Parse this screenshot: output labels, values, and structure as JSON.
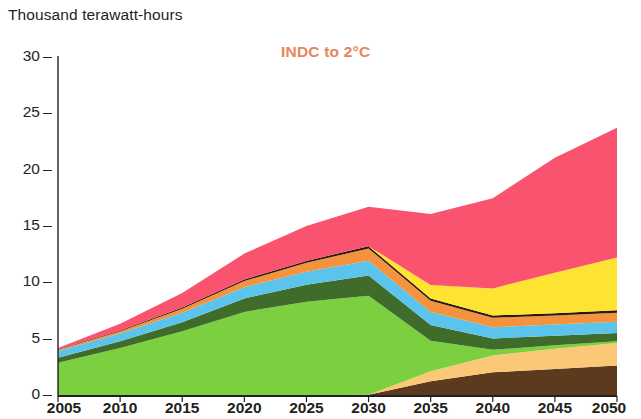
{
  "chart_data": {
    "type": "area",
    "title": "INDC to 2°C",
    "title_color": "#e8865a",
    "ylabel": "Thousand terawatt-hours",
    "xlabel": "",
    "stacked": true,
    "grid": false,
    "legend_position": "none",
    "xlim": [
      2005,
      2050
    ],
    "ylim": [
      0,
      30
    ],
    "ytick_labels": [
      "0",
      "5",
      "10",
      "15",
      "20",
      "25",
      "30"
    ],
    "ytick_values": [
      0,
      5,
      10,
      15,
      20,
      25,
      30
    ],
    "xtick_labels": [
      "2005",
      "2010",
      "2015",
      "2020",
      "2025",
      "2030",
      "2035",
      "2040",
      "2045",
      "2050"
    ],
    "x": [
      2005,
      2010,
      2015,
      2020,
      2025,
      2030,
      2035,
      2040,
      2045,
      2050
    ],
    "series": [
      {
        "name": "coal",
        "color": "#5c3a1d",
        "values": [
          0.05,
          0.05,
          0.05,
          0.06,
          0.07,
          0.1,
          1.3,
          2.1,
          2.4,
          2.7
        ]
      },
      {
        "name": "natural-gas",
        "color": "#fac877",
        "values": [
          0.0,
          0.0,
          0.0,
          0.0,
          0.0,
          0.0,
          0.9,
          1.5,
          1.8,
          2.0
        ]
      },
      {
        "name": "fossil-mix",
        "color": "#7ccf3f",
        "values": [
          2.9,
          4.2,
          5.7,
          7.4,
          8.3,
          8.8,
          2.7,
          0.5,
          0.3,
          0.15
        ]
      },
      {
        "name": "nuclear",
        "color": "#3f6b2b",
        "values": [
          0.45,
          0.6,
          0.8,
          1.2,
          1.5,
          1.8,
          1.4,
          1.0,
          0.85,
          0.75
        ]
      },
      {
        "name": "hydro",
        "color": "#5bc4ec",
        "values": [
          0.6,
          0.7,
          0.85,
          1.0,
          1.15,
          1.3,
          1.15,
          1.0,
          1.0,
          1.0
        ]
      },
      {
        "name": "bioenergy",
        "color": "#f5923e",
        "values": [
          0.1,
          0.2,
          0.35,
          0.55,
          0.8,
          1.1,
          1.0,
          0.85,
          0.8,
          0.8
        ]
      },
      {
        "name": "geothermal",
        "color": "#2b1a0c",
        "values": [
          0.05,
          0.07,
          0.1,
          0.13,
          0.17,
          0.2,
          0.2,
          0.2,
          0.2,
          0.2
        ]
      },
      {
        "name": "wind",
        "color": "#ffe332",
        "values": [
          0.0,
          0.0,
          0.0,
          0.0,
          0.0,
          0.0,
          1.2,
          2.4,
          3.6,
          4.7
        ]
      },
      {
        "name": "solar",
        "color": "#f9536f",
        "values": [
          0.1,
          0.6,
          1.3,
          2.3,
          3.1,
          3.5,
          6.3,
          8.0,
          10.2,
          11.5
        ]
      }
    ]
  },
  "axes": {
    "unit_label": "Thousand terawatt-hours"
  }
}
